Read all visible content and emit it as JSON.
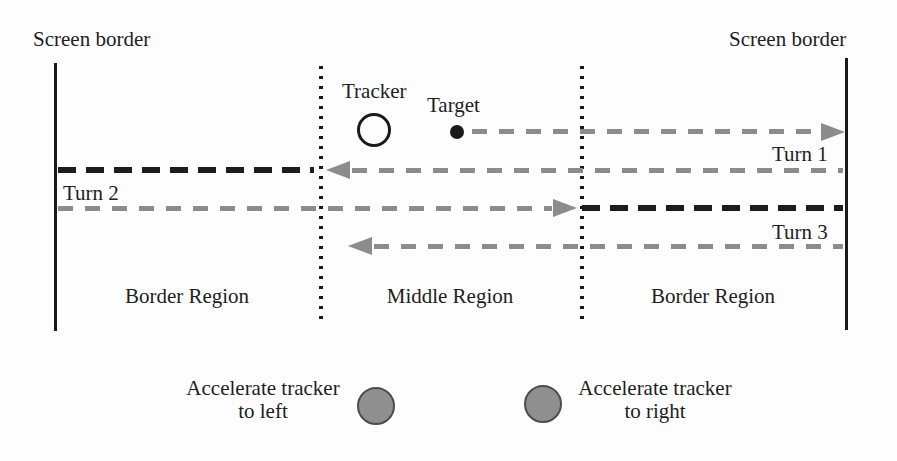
{
  "figure": {
    "screen_border_left": "Screen border",
    "screen_border_right": "Screen border",
    "tracker_label": "Tracker",
    "target_label": "Target",
    "turns": {
      "turn1": "Turn 1",
      "turn2": "Turn 2",
      "turn3": "Turn 3"
    },
    "regions": {
      "left": "Border Region",
      "middle": "Middle Region",
      "right": "Border Region"
    },
    "legend": {
      "left": {
        "line1": "Accelerate tracker",
        "line2": "to left"
      },
      "right": {
        "line1": "Accelerate tracker",
        "line2": "to right"
      }
    }
  },
  "colors": {
    "background": "#fdfdfd",
    "text": "#1e1e1e",
    "line": "#1a1a1a",
    "gray-path": "#8c8c8c",
    "black-path": "#1c1c1c",
    "legend-circle-fill": "#8f8f8f",
    "legend-circle-border": "#4d4d4d"
  }
}
